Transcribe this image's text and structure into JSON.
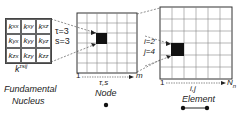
{
  "nucleus": {
    "cells": [
      {
        "base": "k",
        "sub": "xx"
      },
      {
        "base": "k",
        "sub": "xy"
      },
      {
        "base": "k",
        "sub": "xz"
      },
      {
        "base": "k",
        "sub": "yx"
      },
      {
        "base": "k",
        "sub": "yy"
      },
      {
        "base": "k",
        "sub": "yz"
      },
      {
        "base": "k",
        "sub": "zx"
      },
      {
        "base": "k",
        "sub": "zy"
      },
      {
        "base": "k",
        "sub": "zz"
      }
    ],
    "tau_label": "τ=3",
    "s_label": "s=3",
    "symbol_base": "k",
    "symbol_sup": "τsij",
    "caption_line1": "Fundamental",
    "caption_line2": "Nucleus"
  },
  "node": {
    "axis_start": "1",
    "axis_end": "m",
    "axis_label": "τ,s",
    "caption": "Node",
    "grid_size": 6,
    "highlight": {
      "row": 2,
      "col": 2
    }
  },
  "element": {
    "i_label": "i=2",
    "j_label": "j=4",
    "axis_start": "1",
    "axis_end_base": "N",
    "axis_end_sub": "n",
    "axis_label": "i,j",
    "caption": "Element",
    "grid_size": 6,
    "highlight": {
      "row": 3,
      "col": 1
    }
  }
}
